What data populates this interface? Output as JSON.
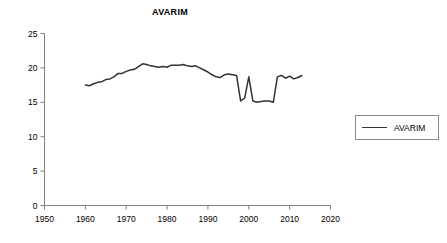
{
  "chart_data": {
    "type": "line",
    "title": "AVARIM",
    "xlabel": "",
    "ylabel": "",
    "xlim": [
      1950,
      2020
    ],
    "ylim": [
      0,
      25
    ],
    "grid": false,
    "legend": {
      "position": "right",
      "entries": [
        "AVARIM"
      ]
    },
    "xticks": [
      1950,
      1960,
      1970,
      1980,
      1990,
      2000,
      2010,
      2020
    ],
    "yticks": [
      0,
      5,
      10,
      15,
      20,
      25
    ],
    "series": [
      {
        "name": "AVARIM",
        "color": "#333333",
        "x": [
          1960,
          1961,
          1962,
          1963,
          1964,
          1965,
          1966,
          1967,
          1968,
          1969,
          1970,
          1971,
          1972,
          1973,
          1974,
          1975,
          1976,
          1977,
          1978,
          1979,
          1980,
          1981,
          1982,
          1983,
          1984,
          1985,
          1986,
          1987,
          1988,
          1989,
          1990,
          1991,
          1992,
          1993,
          1994,
          1995,
          1996,
          1997,
          1998,
          1999,
          2000,
          2001,
          2002,
          2003,
          2004,
          2005,
          2006,
          2007,
          2008,
          2009,
          2010,
          2011,
          2012,
          2013
        ],
        "values": [
          17.5,
          17.4,
          17.7,
          17.9,
          18.0,
          18.3,
          18.4,
          18.7,
          19.2,
          19.2,
          19.5,
          19.7,
          19.8,
          20.2,
          20.6,
          20.5,
          20.3,
          20.2,
          20.1,
          20.2,
          20.1,
          20.4,
          20.4,
          20.4,
          20.5,
          20.3,
          20.2,
          20.3,
          20.0,
          19.7,
          19.4,
          19.0,
          18.7,
          18.6,
          19.0,
          19.1,
          19.0,
          18.9,
          15.2,
          15.6,
          18.7,
          15.2,
          15.0,
          15.1,
          15.2,
          15.2,
          15.0,
          18.7,
          18.9,
          18.5,
          18.8,
          18.4,
          18.6,
          18.9
        ]
      }
    ]
  },
  "legend": {
    "label": "AVARIM"
  }
}
